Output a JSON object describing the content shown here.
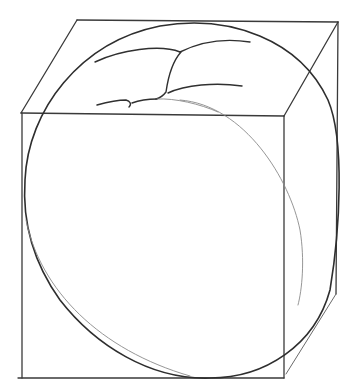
{
  "image": {
    "title": "Pencil sketch: sphere-like form inscribed in a cube",
    "description": "Construction drawing of a rounded object (e.g., a peach or pumpkin) inside a wireframe cube with perspective top face",
    "colors": {
      "background": "#ffffff",
      "pencil_dark": "#2e2e2e",
      "pencil_medium": "#3a3a3a",
      "pencil_light": "#8a8a8a"
    },
    "elements": {
      "cube": "wireframe-cube",
      "sphere": "inscribed-ellipse",
      "folds": "top-fold-lines",
      "inner_arc": "back-contour-arc"
    }
  }
}
